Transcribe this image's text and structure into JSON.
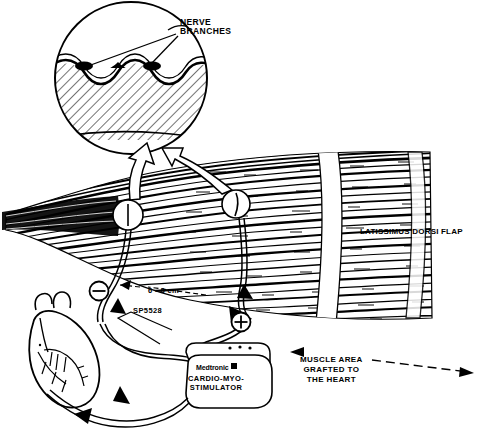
{
  "figure": {
    "ink_color": "#000000",
    "background_color": "#ffffff"
  },
  "labels": {
    "nerve_branches": "NERVE\nBRANCHES",
    "latissimus_dorsi_flap": "LATISSIMUS DORSI FLAP",
    "muscle_area_grafted": "MUSCLE AREA\nGRAFTED TO\nTHE HEART",
    "electrode_spacing": "6 - 8 cm",
    "lead_model": "SP5528",
    "brand": "Medtronic",
    "device_name": "CARDIO-MYO-\nSTIMULATOR"
  },
  "markers": {
    "cathode_symbol": "⊖",
    "anode_symbol": "⊕",
    "cathode_name": "negative-electrode",
    "anode_name": "positive-electrode"
  },
  "icons": {
    "magnifier": "inset-circle-icon",
    "callout_arrow": "hollow-callout-arrow-icon",
    "dimension_arrow": "dimension-arrow-icon",
    "lead_arrow": "lead-direction-arrow-icon",
    "heart": "heart-icon",
    "brand_mark": "medtronic-logo-square-icon"
  }
}
